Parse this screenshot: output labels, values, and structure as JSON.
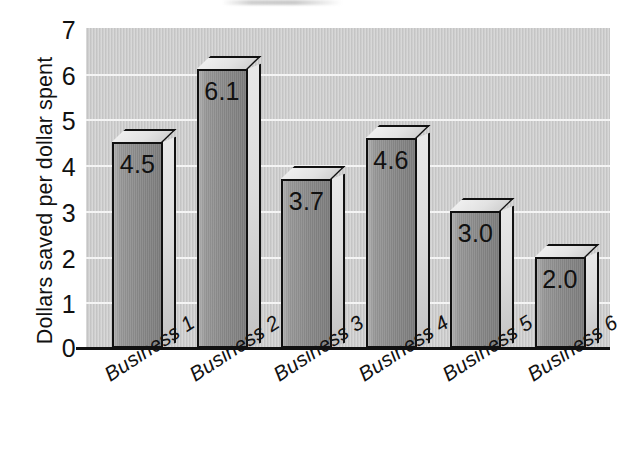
{
  "chart_data": {
    "type": "bar",
    "title": "",
    "subtitle": "",
    "xlabel": "",
    "ylabel": "Dollars saved per dollar spent",
    "categories": [
      "Business 1",
      "Business 2",
      "Business 3",
      "Business 4",
      "Business 5",
      "Business 6"
    ],
    "values": [
      4.5,
      6.1,
      3.7,
      4.6,
      3.0,
      2.0
    ],
    "value_labels": [
      "4.5",
      "6.1",
      "3.7",
      "4.6",
      "3.0",
      "2.0"
    ],
    "ylim": [
      0,
      7
    ],
    "ytick_labels": [
      "0",
      "1",
      "2",
      "3",
      "4",
      "5",
      "6",
      "7"
    ],
    "ytick_values": [
      0,
      1,
      2,
      3,
      4,
      5,
      6,
      7
    ],
    "grid": "horizontal-white-gridlines",
    "legend": "none",
    "style": "3d-block-bars",
    "xtick_label_rotation": -33,
    "colors": {
      "plot_background": "#c9c9c9",
      "gridline": "#f4f4f4",
      "bar_front": "#8d8d8d",
      "bar_top": "#e6e6e6",
      "bar_side": "#d7d7d7",
      "bar_outline": "#111111",
      "axis": "#111111",
      "text": "#111111",
      "page_background": "#ffffff"
    }
  }
}
